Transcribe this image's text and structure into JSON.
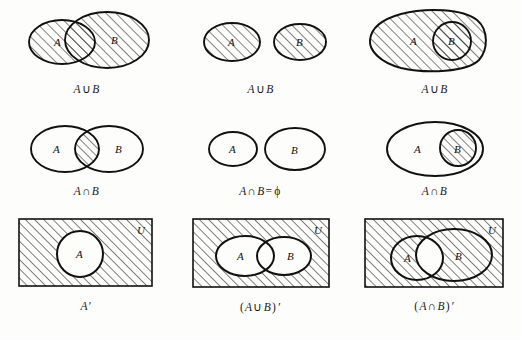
{
  "figure": {
    "background_color": "#fdfdfb",
    "ink_color": "#111111",
    "hatch_color": "#1a1a1a",
    "hatch_direction": "diagonal-up-right"
  },
  "labels": {
    "set_a": "A",
    "set_b": "B",
    "universe": "U"
  },
  "panels": [
    {
      "id": "union-overlapping",
      "row": 1,
      "col": 1,
      "caption": "A ∪ B",
      "caption_parts": {
        "left": "A",
        "operator": "∪",
        "right": "B"
      },
      "relation": "overlapping",
      "shaded_region": "A union B (both ellipses fully hatched)",
      "set_labels": [
        "A",
        "B"
      ],
      "has_universe_rectangle": false
    },
    {
      "id": "union-disjoint",
      "row": 1,
      "col": 2,
      "caption": "A ∪ B",
      "caption_parts": {
        "left": "A",
        "operator": "∪",
        "right": "B"
      },
      "relation": "disjoint",
      "shaded_region": "A union B (both separate ellipses fully hatched)",
      "set_labels": [
        "A",
        "B"
      ],
      "has_universe_rectangle": false
    },
    {
      "id": "union-subset",
      "row": 1,
      "col": 3,
      "caption": "A ∪ B",
      "caption_parts": {
        "left": "A",
        "operator": "∪",
        "right": "B"
      },
      "relation": "B subset of A",
      "shaded_region": "A union B = A (whole blob hatched)",
      "set_labels": [
        "A",
        "B"
      ],
      "has_universe_rectangle": false
    },
    {
      "id": "intersection-overlapping",
      "row": 2,
      "col": 1,
      "caption": "A ∩ B",
      "caption_parts": {
        "left": "A",
        "operator": "∩",
        "right": "B"
      },
      "relation": "overlapping",
      "shaded_region": "lens-shaped intersection only",
      "set_labels": [
        "A",
        "B"
      ],
      "has_universe_rectangle": false
    },
    {
      "id": "intersection-empty",
      "row": 2,
      "col": 2,
      "caption": "A ∩ B = ϕ",
      "caption_parts": {
        "left": "A",
        "operator": "∩",
        "right": "B",
        "equals": "=",
        "result": "ϕ"
      },
      "relation": "disjoint",
      "shaded_region": "none (empty intersection)",
      "set_labels": [
        "A",
        "B"
      ],
      "has_universe_rectangle": false
    },
    {
      "id": "intersection-subset",
      "row": 2,
      "col": 3,
      "caption": "A ∩ B",
      "caption_parts": {
        "left": "A",
        "operator": "∩",
        "right": "B"
      },
      "relation": "B subset of A",
      "shaded_region": "B only (inner circle hatched)",
      "set_labels": [
        "A",
        "B"
      ],
      "has_universe_rectangle": false
    },
    {
      "id": "complement-a",
      "row": 3,
      "col": 1,
      "caption": "A'",
      "caption_parts": {
        "left": "A",
        "prime": "′"
      },
      "relation": "single set in universe",
      "shaded_region": "universe outside A",
      "set_labels": [
        "A"
      ],
      "has_universe_rectangle": true
    },
    {
      "id": "complement-union",
      "row": 3,
      "col": 2,
      "caption": "(A ∪ B)'",
      "caption_parts": {
        "open": "(",
        "left": "A",
        "operator": "∪",
        "right": "B",
        "close": ")",
        "prime": "′"
      },
      "relation": "overlapping sets in universe",
      "shaded_region": "universe outside A union B",
      "set_labels": [
        "A",
        "B"
      ],
      "has_universe_rectangle": true
    },
    {
      "id": "complement-intersection",
      "row": 3,
      "col": 3,
      "caption": "(A ∩ B)'",
      "caption_parts": {
        "open": "(",
        "left": "A",
        "operator": "∩",
        "right": "B",
        "close": ")",
        "prime": "′"
      },
      "relation": "overlapping sets in universe",
      "shaded_region": "everything except the lens intersection",
      "set_labels": [
        "A",
        "B"
      ],
      "has_universe_rectangle": true
    }
  ]
}
